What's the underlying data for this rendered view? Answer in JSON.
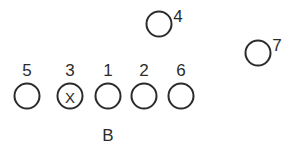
{
  "diagram": {
    "background_color": "#ffffff",
    "stroke_color": "#2b2b2b",
    "width": 294,
    "height": 161,
    "players": [
      {
        "label": "5",
        "cx": 27,
        "cy": 96,
        "r": 12.5,
        "label_x": 27,
        "label_y": 76,
        "label_position": "above",
        "mark": "",
        "name": "player-5"
      },
      {
        "label": "3",
        "cx": 70,
        "cy": 96,
        "r": 12.5,
        "label_x": 70,
        "label_y": 76,
        "label_position": "above",
        "mark": "X",
        "name": "player-3-center"
      },
      {
        "label": "1",
        "cx": 108,
        "cy": 96,
        "r": 12.5,
        "label_x": 108,
        "label_y": 76,
        "label_position": "above",
        "mark": "",
        "name": "player-1"
      },
      {
        "label": "2",
        "cx": 144,
        "cy": 96,
        "r": 12.5,
        "label_x": 144,
        "label_y": 76,
        "label_position": "above",
        "mark": "",
        "name": "player-2"
      },
      {
        "label": "6",
        "cx": 181,
        "cy": 96,
        "r": 12.5,
        "label_x": 181,
        "label_y": 76,
        "label_position": "above",
        "mark": "",
        "name": "player-6"
      },
      {
        "label": "4",
        "cx": 159,
        "cy": 24,
        "r": 12.5,
        "label_x": 178,
        "label_y": 22,
        "label_position": "upper-right",
        "mark": "",
        "name": "player-4"
      },
      {
        "label": "7",
        "cx": 258,
        "cy": 53,
        "r": 12.5,
        "label_x": 277,
        "label_y": 51,
        "label_position": "upper-right",
        "mark": "",
        "name": "player-7"
      }
    ],
    "zone_labels": [
      {
        "text": "B",
        "x": 108,
        "y": 141,
        "name": "zone-label-b"
      }
    ]
  }
}
